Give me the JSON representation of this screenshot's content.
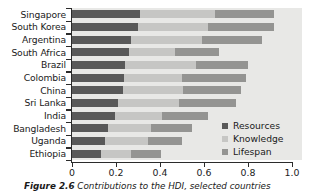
{
  "chart_data": {
    "type": "bar",
    "orientation": "horizontal",
    "stacked": true,
    "title": "",
    "xlabel": "",
    "ylabel": "",
    "xlim": [
      0,
      1.0
    ],
    "xticks": [
      "0",
      "0.2",
      "0.4",
      "0.6",
      "0.8",
      "1.0"
    ],
    "xtick_values": [
      0,
      0.2,
      0.4,
      0.6,
      0.8,
      1.0
    ],
    "grid": false,
    "legend_position": "lower-right",
    "categories": [
      "Singapore",
      "South Korea",
      "Argentina",
      "South Africa",
      "Brazil",
      "Colombia",
      "China",
      "Sri Lanka",
      "India",
      "Bangladesh",
      "Uganda",
      "Ethiopia"
    ],
    "series": [
      {
        "name": "Resources",
        "color": "#595959",
        "values": [
          0.31,
          0.3,
          0.27,
          0.26,
          0.24,
          0.235,
          0.23,
          0.21,
          0.195,
          0.165,
          0.15,
          0.13
        ]
      },
      {
        "name": "Knowledge",
        "color": "#c6c6c4",
        "values": [
          0.34,
          0.32,
          0.32,
          0.21,
          0.325,
          0.265,
          0.275,
          0.275,
          0.215,
          0.195,
          0.195,
          0.14
        ]
      },
      {
        "name": "Lifespan",
        "color": "#949492",
        "values": [
          0.27,
          0.3,
          0.275,
          0.2,
          0.235,
          0.29,
          0.265,
          0.26,
          0.21,
          0.185,
          0.155,
          0.135
        ]
      }
    ],
    "totals": [
      0.92,
      0.92,
      0.865,
      0.67,
      0.8,
      0.79,
      0.77,
      0.745,
      0.62,
      0.545,
      0.5,
      0.405
    ]
  },
  "legend": {
    "items": [
      {
        "label": "Resources",
        "color": "#595959"
      },
      {
        "label": "Knowledge",
        "color": "#c6c6c4"
      },
      {
        "label": "Lifespan",
        "color": "#949492"
      }
    ]
  },
  "caption": {
    "label": "Figure 2.6",
    "text": "Contributions to the HDI, selected countries"
  },
  "colors": {
    "panel_background": "#e8e8e6",
    "axis": "#2b2b2b",
    "text": "#1a1a1a"
  }
}
